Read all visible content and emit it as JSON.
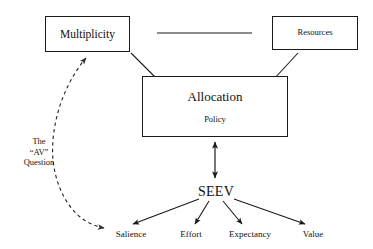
{
  "diagram": {
    "nodes": {
      "multiplicity": {
        "label": "Multiplicity"
      },
      "resources": {
        "label": "Resources"
      },
      "allocation": {
        "title": "Allocation",
        "subtitle": "Policy"
      },
      "seev": {
        "label": "SEEV"
      }
    },
    "annotations": {
      "av_question": "The\n\"AV\"\nQuestion",
      "av_question_lines": [
        "The",
        "“AV”",
        "Question"
      ]
    },
    "outcomes": [
      {
        "label": "Salience"
      },
      {
        "label": "Effort"
      },
      {
        "label": "Expectancy"
      },
      {
        "label": "Value"
      }
    ],
    "colors": {
      "stroke": "#1a1a1a",
      "dashed_stroke": "#333333",
      "text": "#111111",
      "background": "#ffffff"
    }
  }
}
